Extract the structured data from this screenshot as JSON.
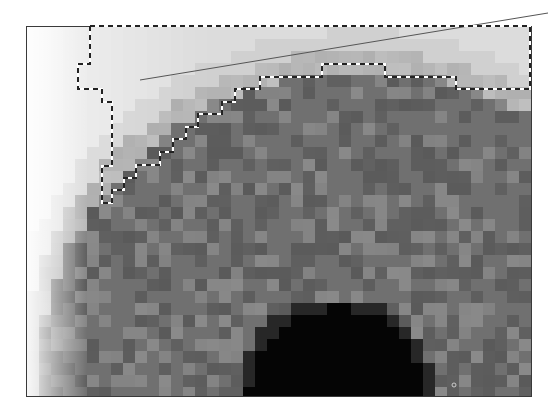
{
  "figure": {
    "frame": {
      "x": 26,
      "y": 26,
      "width": 504,
      "height": 369,
      "border_color": "#3a3a3a"
    },
    "pixel_size": 12,
    "colors": {
      "background_far": "#f4f4f4",
      "background_near": "#dcdcdc",
      "iris_light": "#8a8a8a",
      "iris_mid": "#707070",
      "iris_dark": "#5a5a5a",
      "pupil": "#050505",
      "marquee_dark": "#222222",
      "marquee_light": "#ffffff",
      "leader_line": "#555555"
    },
    "iris_center": {
      "x": 360,
      "y": 395
    },
    "iris_radius": 345,
    "pupil_center": {
      "x": 335,
      "y": 395
    },
    "pupil_radius": 88,
    "selection_path": [
      [
        90,
        26
      ],
      [
        530,
        26
      ],
      [
        530,
        89
      ],
      [
        456,
        89
      ],
      [
        456,
        77
      ],
      [
        385,
        77
      ],
      [
        385,
        64
      ],
      [
        322,
        64
      ],
      [
        322,
        77
      ],
      [
        260,
        77
      ],
      [
        260,
        89
      ],
      [
        235,
        89
      ],
      [
        235,
        102
      ],
      [
        222,
        102
      ],
      [
        222,
        114
      ],
      [
        198,
        114
      ],
      [
        198,
        127
      ],
      [
        186,
        127
      ],
      [
        186,
        139
      ],
      [
        173,
        139
      ],
      [
        173,
        152
      ],
      [
        160,
        152
      ],
      [
        160,
        165
      ],
      [
        136,
        165
      ],
      [
        136,
        178
      ],
      [
        124,
        178
      ],
      [
        124,
        190
      ],
      [
        112,
        190
      ],
      [
        112,
        203
      ],
      [
        102,
        203
      ],
      [
        102,
        166
      ],
      [
        112,
        166
      ],
      [
        112,
        102
      ],
      [
        102,
        102
      ],
      [
        102,
        89
      ],
      [
        78,
        89
      ],
      [
        78,
        64
      ],
      [
        90,
        64
      ],
      [
        90,
        26
      ]
    ],
    "leader_line": {
      "x1": 140,
      "y1": 80,
      "x2": 548,
      "y2": 13
    },
    "marker": {
      "x": 454,
      "y": 385,
      "r": 2
    }
  }
}
